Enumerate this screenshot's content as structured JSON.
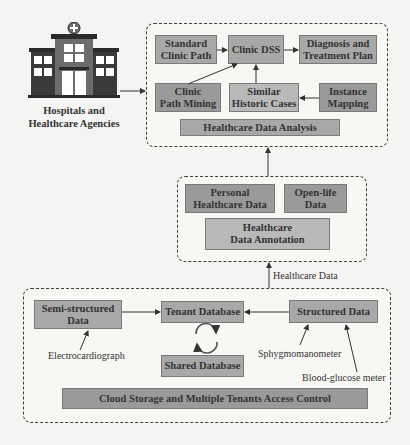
{
  "hospital": {
    "label": "Hospitals and\nHealthcare Agencies",
    "icon": "hospital-building-icon"
  },
  "analysis_group": {
    "boxes": {
      "standard_clinic_path": "Standard\nClinic Path",
      "clinic_dss": "Clinic DSS",
      "diagnosis_treatment": "Diagnosis and\nTreatment Plan",
      "clinic_path_mining": "Clinic\nPath Mining",
      "similar_historic_cases": "Similar\nHistoric Cases",
      "instance_mapping": "Instance\nMapping",
      "healthcare_data_analysis": "Healthcare Data Analysis"
    }
  },
  "annotation_group": {
    "boxes": {
      "personal_healthcare_data": "Personal\nHealthcare Data",
      "open_life_data": "Open-life\nData",
      "healthcare_data_annotation": "Healthcare\nData Annotation"
    }
  },
  "flow_label": "Healthcare Data",
  "storage_group": {
    "boxes": {
      "semi_structured_data": "Semi-structured\nData",
      "tenant_database": "Tenant Database",
      "structured_data": "Structured Data",
      "shared_database": "Shared Database",
      "cloud_storage": "Cloud Storage and Multiple Tenants Access Control"
    },
    "devices": {
      "electrocardiograph": "Electrocardiograph",
      "sphygmomanometer": "Sphygmomanometer",
      "blood_glucose_meter": "Blood-glucose meter"
    }
  },
  "colors": {
    "box_light": "#b9b9b9",
    "box_dark": "#9a9a9a",
    "border_dashed": "#3e3e3e",
    "background": "#f4f4f2"
  }
}
